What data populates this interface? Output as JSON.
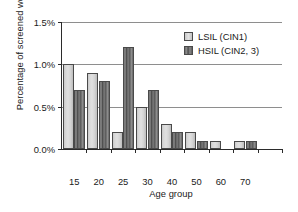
{
  "chart_data": {
    "type": "bar",
    "title": "",
    "xlabel": "Age group",
    "ylabel": "Percentage of screened women",
    "categories": [
      "15",
      "20",
      "25",
      "30",
      "40",
      "50",
      "60",
      "70"
    ],
    "series": [
      {
        "name": "LSIL (CIN1)",
        "values": [
          1.0,
          0.9,
          0.2,
          0.5,
          0.3,
          0.2,
          0.1,
          0.1
        ]
      },
      {
        "name": "HSIL (CIN2, 3)",
        "values": [
          0.7,
          0.8,
          1.2,
          0.7,
          0.2,
          0.1,
          0.0,
          0.1
        ]
      }
    ],
    "ylim": [
      0.0,
      1.5
    ],
    "yticks": [
      "0.0%",
      "0.5%",
      "1.0%",
      "1.5%"
    ],
    "ytick_values": [
      0.0,
      0.5,
      1.0,
      1.5
    ],
    "grid": "horizontal",
    "legend_position": "top-right",
    "colors": {
      "lsil": "#d8d8d8",
      "hsil": "#6e6e6e",
      "axis": "#2b2b2b",
      "grid": "#8e8e8e",
      "text": "#1a1a1a",
      "background": "#ffffff"
    }
  },
  "legend": {
    "items": [
      {
        "label": "LSIL (CIN1)"
      },
      {
        "label": "HSIL (CIN2, 3)"
      }
    ]
  }
}
